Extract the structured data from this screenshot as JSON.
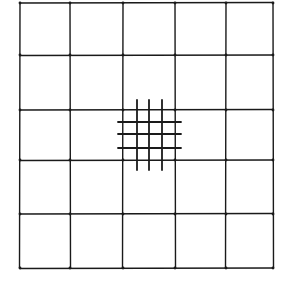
{
  "diagram": {
    "type": "grid-with-refined-subgrid",
    "stroke_color": "#1a1a1a",
    "background": "#ffffff",
    "coarse_grid": {
      "rows": 5,
      "cols": 5,
      "x_lines": [
        20,
        70,
        123,
        175,
        226,
        273
      ],
      "y_lines": [
        3,
        55,
        110,
        160,
        214,
        268
      ]
    },
    "fine_grid": {
      "cell": {
        "row": 2,
        "col": 2
      },
      "x_lines": [
        137,
        149,
        162
      ],
      "y_lines": [
        122,
        134,
        148
      ],
      "x_extent": [
        118,
        181
      ],
      "y_extent": [
        100,
        170
      ]
    }
  }
}
